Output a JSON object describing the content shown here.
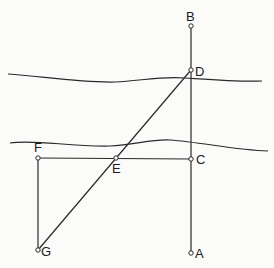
{
  "diagram": {
    "type": "geometric-construction",
    "colors": {
      "line": "#2a2a2a",
      "point_fill": "#ffffff",
      "background": "#fbfbfa"
    },
    "points": [
      {
        "id": "B",
        "label": "B",
        "x": 191,
        "y": 26
      },
      {
        "id": "D",
        "label": "D",
        "x": 191,
        "y": 70
      },
      {
        "id": "C",
        "label": "C",
        "x": 191,
        "y": 159
      },
      {
        "id": "A",
        "label": "A",
        "x": 191,
        "y": 253
      },
      {
        "id": "F",
        "label": "F",
        "x": 38,
        "y": 158
      },
      {
        "id": "E",
        "label": "E",
        "x": 116,
        "y": 158
      },
      {
        "id": "G",
        "label": "G",
        "x": 38,
        "y": 250
      }
    ],
    "segments": [
      [
        "B",
        "A"
      ],
      [
        "F",
        "C"
      ],
      [
        "F",
        "G"
      ],
      [
        "G",
        "D"
      ]
    ],
    "riverbanks": [
      {
        "name": "upper-bank"
      },
      {
        "name": "lower-bank"
      }
    ]
  }
}
